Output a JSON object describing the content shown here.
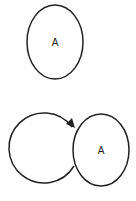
{
  "diagram": {
    "top_state": {
      "label": "A"
    },
    "bottom_left_state": {
      "label": ""
    },
    "bottom_right_state": {
      "label": "A"
    },
    "edge": {
      "from": "bottom_left_state",
      "to": "bottom_right_state",
      "style": "arrow"
    },
    "colors": {
      "stroke": "#222222",
      "background": "#ffffff"
    }
  }
}
